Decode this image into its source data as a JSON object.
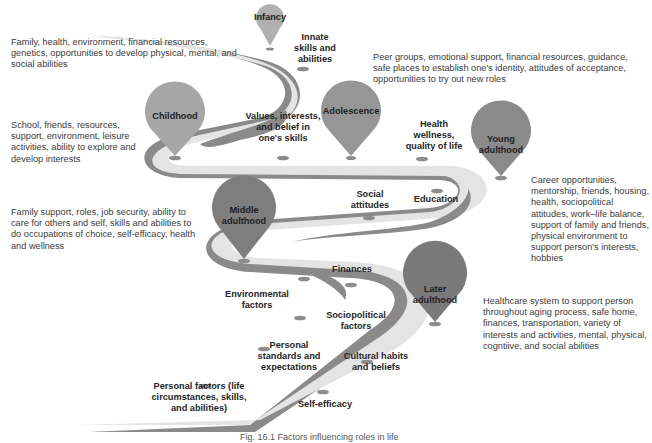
{
  "figure": {
    "caption": "Fig. 16.1 Factors influencing roles in life",
    "colors": {
      "road_top": "#e3e3e3",
      "road_side": "#8a8a8a",
      "marker": "#8c8c8c",
      "pin_light": "#a9a9a9",
      "pin_medium": "#9a9a9a",
      "pin_dark": "#858585"
    }
  },
  "stages": [
    {
      "label": "Infancy",
      "description": "Family, health, environment, financial resources, genetics, opportunities to develop physical, mental, and social abilities"
    },
    {
      "label": "Childhood",
      "description": "School, friends, resources, support, environment, leisure activities, ability to explore and develop interests"
    },
    {
      "label": "Adolescence",
      "description": "Peer groups, emotional support, financial resources, guidance, safe places to establish one's identity, attitudes of acceptance, opportunities to try out new roles"
    },
    {
      "label": "Young adulthood",
      "description": "Career opportunities, mentorship, friends, housing, health, sociopolitical attitudes, work–life balance, support of family and friends, physical environment to support person's interests, hobbies"
    },
    {
      "label": "Middle adulthood",
      "description": "Family support, roles, job security, ability to care for others and self, skills and abilities to do occupations of choice, self-efficacy, health and wellness"
    },
    {
      "label": "Later adulthood",
      "description": "Healthcare system to support person throughout aging process, safe home, finances, transportation, variety of interests and activities, mental, physical, cogntiive, and social abilities"
    }
  ],
  "factors": [
    "Innate skills and abilities",
    "Values, interests, and belief in one's skills",
    "Health wellness, quality of life",
    "Social attitudes",
    "Education",
    "Finances",
    "Environmental factors",
    "Sociopolitical factors",
    "Personal standards and expectations",
    "Cultural habits and beliefs",
    "Personal factors (life circumstances, skills, and abilities)",
    "Self-efficacy"
  ]
}
